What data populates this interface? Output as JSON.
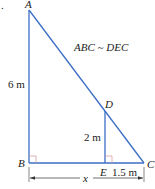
{
  "diagram": {
    "marker": ".",
    "points": {
      "A": {
        "label": "A"
      },
      "B": {
        "label": "B"
      },
      "C": {
        "label": "C"
      },
      "D": {
        "label": "D"
      },
      "E": {
        "label": "E"
      }
    },
    "similarity": "ABC ~ DEC",
    "measurements": {
      "AB": "6 m",
      "DE": "2 m",
      "EC": "1.5 m",
      "BC": "x"
    },
    "colors": {
      "line": "#3b6fc6",
      "right_angle": "#d9a0a0",
      "dimension": "#333333"
    }
  }
}
